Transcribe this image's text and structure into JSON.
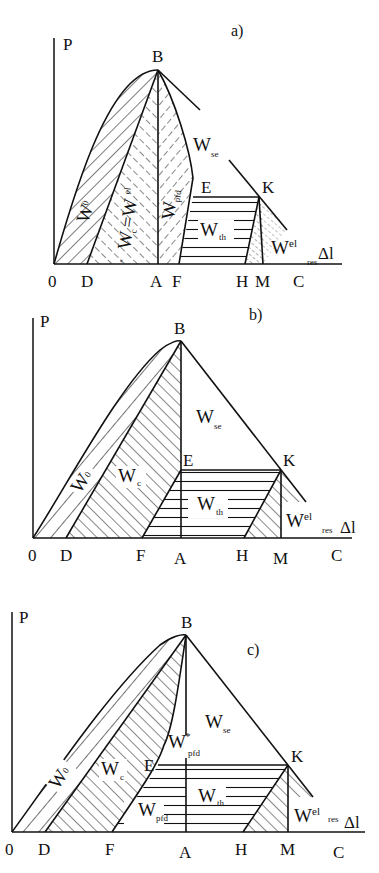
{
  "figure": {
    "ink_color": "#111111",
    "background": "#ffffff"
  },
  "panels": [
    {
      "id": "a",
      "tag": "a)",
      "tag_pos": [
        231,
        36
      ],
      "axis": {
        "origin": [
          54,
          264
        ],
        "y_top": 38,
        "x_end": 342,
        "y_label": "P",
        "x_label": "Δl",
        "y_label_pos": [
          63,
          50
        ],
        "x_label_pos": [
          318,
          259
        ]
      },
      "points": {
        "B": {
          "label": "B",
          "pos": [
            158,
            70
          ],
          "label_pos": [
            152,
            62
          ]
        },
        "E": {
          "label": "E",
          "pos": [
            195,
            197
          ],
          "label_pos": [
            205,
            193
          ]
        },
        "K": {
          "label": "K",
          "pos": [
            259,
            197
          ],
          "label_pos": [
            263,
            193
          ]
        }
      },
      "ticks": [
        {
          "label": "0",
          "x": 53
        },
        {
          "label": "D",
          "x": 87
        },
        {
          "label": "A",
          "x": 156
        },
        {
          "label": "F",
          "x": 178
        },
        {
          "label": "H",
          "x": 243
        },
        {
          "label": "M",
          "x": 262
        },
        {
          "label": "C",
          "x": 299
        }
      ],
      "tick_label_y": 287,
      "regions": [
        {
          "name": "W0",
          "text": "W",
          "sub": "0",
          "pos": [
            85,
            220
          ],
          "rotate": -72
        },
        {
          "name": "Wc_eq_Wel",
          "text": "W",
          "sub": "c",
          "extra": "=W",
          "extra_sup": "el",
          "prefix": "\"",
          "pos": [
            126,
            240
          ],
          "rotate": -82
        },
        {
          "name": "Wpfd",
          "text": "W",
          "sub": "pfd",
          "pos": [
            170,
            215
          ],
          "rotate": -84
        },
        {
          "name": "Wse",
          "text": "W",
          "sub": "se",
          "pos": [
            193,
            151
          ],
          "rotate": 0
        },
        {
          "name": "Wth",
          "text": "W",
          "sub": "th",
          "pos": [
            200,
            236
          ],
          "rotate": 0
        },
        {
          "name": "Wel_res",
          "text": "W",
          "sup": "el",
          "sub2": "res",
          "pos": [
            271,
            254
          ],
          "rotate": 0
        }
      ]
    },
    {
      "id": "b",
      "tag": "b)",
      "tag_pos": [
        249,
        320
      ],
      "axis": {
        "origin": [
          33,
          538
        ],
        "y_top": 318,
        "x_end": 352,
        "y_label": "P",
        "x_label": "Δl",
        "y_label_pos": [
          40,
          325
        ],
        "x_label_pos": [
          340,
          533
        ]
      },
      "points": {
        "B": {
          "label": "B",
          "pos": [
            181,
            341
          ],
          "label_pos": [
            174,
            332
          ]
        },
        "E": {
          "label": "E",
          "pos": [
            181,
            470
          ],
          "label_pos": [
            183,
            465
          ]
        },
        "K": {
          "label": "K",
          "pos": [
            281,
            470
          ],
          "label_pos": [
            283,
            465
          ]
        }
      },
      "ticks": [
        {
          "label": "0",
          "x": 33
        },
        {
          "label": "D",
          "x": 66
        },
        {
          "label": "F",
          "x": 141
        },
        {
          "label": "A",
          "x": 180
        },
        {
          "label": "H",
          "x": 243
        },
        {
          "label": "M",
          "x": 281
        },
        {
          "label": "C",
          "x": 337
        }
      ],
      "tick_label_y": 561,
      "regions": [
        {
          "name": "W0",
          "text": "W",
          "sub": "0",
          "pos": [
            80,
            492
          ],
          "rotate": -55
        },
        {
          "name": "Wc",
          "text": "W",
          "sub": "c",
          "pos": [
            118,
            481
          ],
          "rotate": 0
        },
        {
          "name": "Wse",
          "text": "W",
          "sub": "se",
          "pos": [
            196,
            422
          ],
          "rotate": 0
        },
        {
          "name": "Wth",
          "text": "W",
          "sub": "th",
          "pos": [
            197,
            508
          ],
          "rotate": 0
        },
        {
          "name": "Wel_res",
          "text": "W",
          "sup": "el",
          "sub2": "res",
          "pos": [
            286,
            527
          ],
          "rotate": 0
        }
      ]
    },
    {
      "id": "c",
      "tag": "c)",
      "tag_pos": [
        247,
        655
      ],
      "axis": {
        "origin": [
          12,
          832
        ],
        "y_top": 612,
        "x_end": 365,
        "y_label": "P",
        "x_label": "Δl",
        "y_label_pos": [
          19,
          621
        ],
        "x_label_pos": [
          344,
          828
        ]
      },
      "points": {
        "B": {
          "label": "B",
          "pos": [
            186,
            635
          ],
          "label_pos": [
            181,
            627
          ]
        },
        "E": {
          "label": "E",
          "pos": [
            158,
            765
          ],
          "label_pos": [
            144,
            770
          ]
        },
        "K": {
          "label": "K",
          "pos": [
            288,
            765
          ],
          "label_pos": [
            291,
            761
          ]
        }
      },
      "ticks": [
        {
          "label": "0",
          "x": 11
        },
        {
          "label": "D",
          "x": 44
        },
        {
          "label": "F",
          "x": 111
        },
        {
          "label": "A",
          "x": 185
        },
        {
          "label": "H",
          "x": 241
        },
        {
          "label": "M",
          "x": 287
        },
        {
          "label": "C",
          "x": 339
        }
      ],
      "tick_label_y": 855,
      "regions": [
        {
          "name": "W0",
          "text": "W",
          "sub": "0",
          "pos": [
            58,
            788
          ],
          "rotate": -55
        },
        {
          "name": "Wc",
          "text": "W",
          "sub": "c",
          "pos": [
            101,
            774
          ],
          "rotate": 0
        },
        {
          "name": "Wpfd_star",
          "text": "W",
          "sup": "*",
          "sub": "pfd",
          "pos": [
            168,
            747
          ],
          "rotate": 0
        },
        {
          "name": "Wse",
          "text": "W",
          "sub": "se",
          "pos": [
            205,
            727
          ],
          "rotate": 0
        },
        {
          "name": "Wth",
          "text": "W",
          "sub": "th",
          "pos": [
            198,
            800
          ],
          "rotate": 0
        },
        {
          "name": "Wpfd",
          "text": "W",
          "sub": "pfd",
          "pos": [
            138,
            814
          ],
          "rotate": 0
        },
        {
          "name": "Wel_res",
          "text": "W",
          "sup": "el",
          "sub2": "res",
          "pos": [
            294,
            822
          ],
          "rotate": 0
        }
      ]
    }
  ]
}
